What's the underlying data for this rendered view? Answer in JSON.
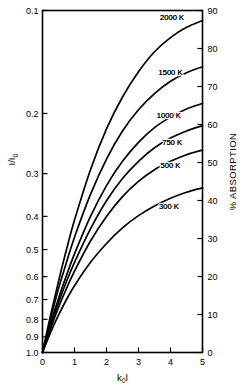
{
  "chart_data": {
    "type": "line",
    "title": "",
    "xlabel": "k₀l",
    "ylabel": "I/I₀",
    "ylabel_right": "% ABSORPTION",
    "xlim": [
      0,
      5
    ],
    "ylim_left": [
      1.0,
      0.1
    ],
    "ylim_right": [
      0,
      90
    ],
    "yscale_left": "log",
    "grid": false,
    "legend": "inline-curve-labels",
    "x_ticks": [
      "0",
      "1",
      "2",
      "3",
      "4",
      "5"
    ],
    "x_tick_values": [
      0,
      1,
      2,
      3,
      4,
      5
    ],
    "y_ticks_left": [
      "0.1",
      "0.2",
      "0.3",
      "0.4",
      "0.5",
      "0.6",
      "0.7",
      "0.8",
      "0.9",
      "1.0"
    ],
    "y_tick_values_left": [
      0.1,
      0.2,
      0.3,
      0.4,
      0.5,
      0.6,
      0.7,
      0.8,
      0.9,
      1.0
    ],
    "y_ticks_right": [
      "90",
      "80",
      "70",
      "60",
      "50",
      "40",
      "30",
      "20",
      "10",
      "0"
    ],
    "y_tick_values_right": [
      90,
      80,
      70,
      60,
      50,
      40,
      30,
      20,
      10,
      0
    ],
    "x": [
      0,
      0.25,
      0.5,
      0.75,
      1,
      1.5,
      2,
      2.5,
      3,
      3.5,
      4,
      4.5,
      5
    ],
    "series": [
      {
        "name": "2000 K",
        "label": "2000 K",
        "color": "#000000",
        "values": [
          1.0,
          0.78,
          0.62,
          0.5,
          0.41,
          0.292,
          0.222,
          0.179,
          0.151,
          0.132,
          0.12,
          0.112,
          0.107
        ]
      },
      {
        "name": "1500 K",
        "label": "1500 K",
        "color": "#000000",
        "values": [
          1.0,
          0.8,
          0.65,
          0.545,
          0.46,
          0.345,
          0.272,
          0.225,
          0.195,
          0.175,
          0.161,
          0.152,
          0.146
        ]
      },
      {
        "name": "1000 K",
        "label": "1000 K",
        "color": "#000000",
        "values": [
          1.0,
          0.825,
          0.695,
          0.595,
          0.515,
          0.4,
          0.325,
          0.276,
          0.243,
          0.22,
          0.205,
          0.194,
          0.187
        ]
      },
      {
        "name": "750 K",
        "label": "750 K",
        "color": "#000000",
        "values": [
          1.0,
          0.838,
          0.715,
          0.62,
          0.545,
          0.435,
          0.36,
          0.31,
          0.276,
          0.252,
          0.236,
          0.225,
          0.217
        ]
      },
      {
        "name": "500 K",
        "label": "500 K",
        "color": "#000000",
        "values": [
          1.0,
          0.852,
          0.738,
          0.65,
          0.578,
          0.472,
          0.4,
          0.35,
          0.316,
          0.292,
          0.276,
          0.264,
          0.256
        ]
      },
      {
        "name": "300 K",
        "label": "300 K",
        "color": "#000000",
        "values": [
          1.0,
          0.875,
          0.778,
          0.7,
          0.638,
          0.545,
          0.48,
          0.432,
          0.398,
          0.373,
          0.354,
          0.34,
          0.33
        ]
      }
    ],
    "curve_label_positions": [
      {
        "name": "2000 K",
        "x": 4.05,
        "y_frac": 0.105
      },
      {
        "name": "1500 K",
        "x": 4.0,
        "y_frac": 0.152
      },
      {
        "name": "1000 K",
        "x": 3.95,
        "y_frac": 0.203
      },
      {
        "name": "750 K",
        "x": 4.05,
        "y_frac": 0.243
      },
      {
        "name": "500 K",
        "x": 4.0,
        "y_frac": 0.284
      },
      {
        "name": "300 K",
        "x": 3.95,
        "y_frac": 0.375
      }
    ],
    "colors": {
      "axis": "#000000",
      "curve": "#000000",
      "background": "#ffffff"
    }
  }
}
